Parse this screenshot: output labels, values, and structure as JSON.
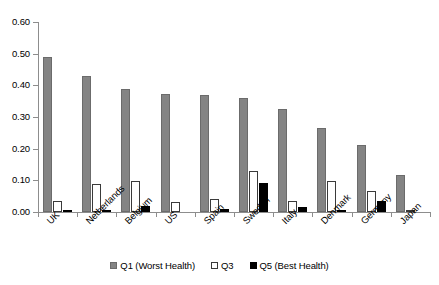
{
  "chart_data": {
    "type": "bar",
    "title": "",
    "subtitle": "",
    "xlabel": "",
    "ylabel": "",
    "ylim": [
      0.0,
      0.6
    ],
    "ytick_labels": [
      "0.00",
      "0.10",
      "0.20",
      "0.30",
      "0.40",
      "0.50",
      "0.60"
    ],
    "ytick_values": [
      0.0,
      0.1,
      0.2,
      0.3,
      0.4,
      0.5,
      0.6
    ],
    "grid": false,
    "legend_position": "bottom",
    "categories": [
      "UK",
      "Netherlands",
      "Belgium",
      "US",
      "Spain",
      "Sweden",
      "Italy",
      "Denmark",
      "Germany",
      "Japan"
    ],
    "series": [
      {
        "name": "Q1 (Worst Health)",
        "color": "#848484",
        "values": [
          0.49,
          0.428,
          0.39,
          0.372,
          0.368,
          0.36,
          0.325,
          0.265,
          0.212,
          0.118
        ]
      },
      {
        "name": "Q3",
        "color": "#ffffff",
        "values": [
          0.035,
          0.088,
          0.097,
          0.033,
          0.04,
          0.128,
          0.035,
          0.098,
          0.065,
          0.006
        ]
      },
      {
        "name": "Q5 (Best Health)",
        "color": "#000000",
        "values": [
          0.003,
          0.006,
          0.018,
          0.0,
          0.01,
          0.092,
          0.017,
          0.006,
          0.035,
          0.0
        ]
      }
    ]
  },
  "legend": {
    "items": [
      {
        "label": "Q1 (Worst Health)",
        "swatch": "q1"
      },
      {
        "label": "Q3",
        "swatch": "q3"
      },
      {
        "label": "Q5 (Best Health)",
        "swatch": "q5"
      }
    ]
  }
}
